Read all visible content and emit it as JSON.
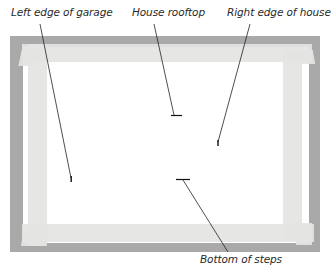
{
  "diagram": {
    "labels": {
      "left_edge_garage": "Left edge of garage",
      "house_rooftop": "House rooftop",
      "right_edge_house": "Right edge of house",
      "bottom_steps": "Bottom of steps"
    },
    "colors": {
      "mat": "#a9a9a9",
      "board": "#ffffff",
      "tape": "#e4e4e2",
      "line": "#222222",
      "text": "#2a2a2a"
    }
  }
}
